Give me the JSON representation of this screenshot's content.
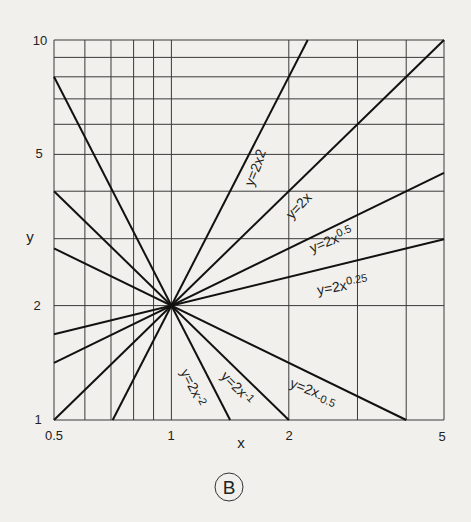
{
  "chart_data": {
    "type": "line",
    "title": "",
    "xlabel": "x",
    "ylabel": "y",
    "xscale": "log",
    "yscale": "log",
    "xlim": [
      0.5,
      5
    ],
    "ylim": [
      1,
      10
    ],
    "grid": true,
    "x_ticks": [
      "0.5",
      "1",
      "2",
      "5"
    ],
    "y_ticks": [
      "1",
      "2",
      "5",
      "10"
    ],
    "x_gridlines": [
      0.5,
      0.6,
      0.7,
      0.8,
      0.9,
      1,
      2,
      3,
      4,
      5
    ],
    "y_gridlines": [
      1,
      2,
      3,
      4,
      5,
      6,
      7,
      8,
      9,
      10
    ],
    "common_point": {
      "x": 1,
      "y": 2
    },
    "series": [
      {
        "name": "y=2x^2",
        "label": "y=2x",
        "exp_label": "2",
        "a": 2,
        "b": 2
      },
      {
        "name": "y=2x",
        "label": "y=2x",
        "exp_label": "",
        "a": 2,
        "b": 1
      },
      {
        "name": "y=2x^0.5",
        "label": "y=2x",
        "exp_label": "0.5",
        "a": 2,
        "b": 0.5
      },
      {
        "name": "y=2x^0.25",
        "label": "y=2x",
        "exp_label": "0.25",
        "a": 2,
        "b": 0.25
      },
      {
        "name": "y=2x^-0.5",
        "label": "y=2x",
        "exp_label": "-0.5",
        "a": 2,
        "b": -0.5
      },
      {
        "name": "y=2x^-1",
        "label": "y=2x",
        "exp_label": "-1",
        "a": 2,
        "b": -1
      },
      {
        "name": "y=2x^-2",
        "label": "y=2x",
        "exp_label": "-2",
        "a": 2,
        "b": -2
      }
    ],
    "annotation": "B"
  },
  "axes": {
    "x_label": "x",
    "y_label": "y",
    "x_tick_0": "0.5",
    "x_tick_1": "1",
    "x_tick_2": "2",
    "x_tick_3": "5",
    "y_tick_0": "1",
    "y_tick_1": "2",
    "y_tick_2": "5",
    "y_tick_3": "10"
  },
  "labels": {
    "l_p2": {
      "base": "y=2x",
      "exp": "2"
    },
    "l_p1": {
      "base": "y=2x",
      "exp": ""
    },
    "l_p05": {
      "base": "y=2x",
      "exp": "0.5"
    },
    "l_p025": {
      "base": "y=2x",
      "exp": "0.25"
    },
    "l_m05": {
      "base": "y=2x",
      "exp": "-0.5"
    },
    "l_m1": {
      "base": "y=2x",
      "exp": "-1"
    },
    "l_m2": {
      "base": "y=2x",
      "exp": "-2"
    }
  },
  "panel_badge": "B"
}
